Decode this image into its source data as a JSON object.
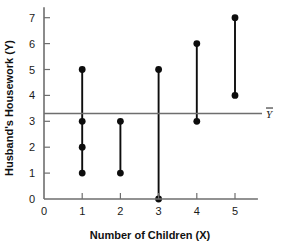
{
  "chart_data": {
    "type": "scatter",
    "title": "",
    "xlabel": "Number of Children (X)",
    "ylabel": "Husband's Housework (Y)",
    "xlim": [
      0,
      5.6
    ],
    "ylim": [
      0,
      7.4
    ],
    "xticks": [
      "0",
      "1",
      "2",
      "3",
      "4",
      "5"
    ],
    "yticks": [
      "0",
      "1",
      "2",
      "3",
      "4",
      "5",
      "6",
      "7"
    ],
    "grid": false,
    "legend": null,
    "annotations": [
      {
        "name": "mean-line-label",
        "text": "Y",
        "overbar": true,
        "value": 3.3,
        "description": "Horizontal reference line at the mean of Y"
      }
    ],
    "reference_lines": [
      {
        "name": "y-mean",
        "orientation": "horizontal",
        "value": 3.3,
        "label": "Y"
      }
    ],
    "points": [
      {
        "x": 1,
        "y": 5
      },
      {
        "x": 1,
        "y": 3
      },
      {
        "x": 1,
        "y": 2
      },
      {
        "x": 1,
        "y": 1
      },
      {
        "x": 2,
        "y": 3
      },
      {
        "x": 2,
        "y": 1
      },
      {
        "x": 3,
        "y": 5
      },
      {
        "x": 3,
        "y": 0
      },
      {
        "x": 4,
        "y": 6
      },
      {
        "x": 4,
        "y": 3
      },
      {
        "x": 5,
        "y": 7
      },
      {
        "x": 5,
        "y": 4
      }
    ],
    "connectors": [
      {
        "x": 1,
        "y_min": 1,
        "y_max": 5
      },
      {
        "x": 2,
        "y_min": 1,
        "y_max": 3
      },
      {
        "x": 3,
        "y_min": 0,
        "y_max": 5
      },
      {
        "x": 4,
        "y_min": 3,
        "y_max": 6
      },
      {
        "x": 5,
        "y_min": 4,
        "y_max": 7
      }
    ],
    "colors": {
      "axis": "#6e6e6e",
      "mean_line": "#6e6e6e",
      "marker": "#0d0d0d",
      "connector": "#0d0d0d",
      "background": "#ffffff"
    }
  }
}
